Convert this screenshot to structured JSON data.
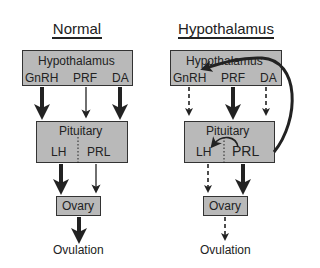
{
  "panels": [
    {
      "title": "Normal",
      "hypothalamus": {
        "label": "Hypothalamus",
        "hormones": [
          "GnRH",
          "PRF",
          "DA"
        ]
      },
      "pituitary": {
        "label": "Pituitary",
        "hormones": [
          "LH",
          "PRL"
        ]
      },
      "ovary": {
        "label": "Ovary"
      },
      "outcome": "Ovulation",
      "arrows": {
        "GnRH": "thick-solid",
        "PRF": "thin-solid",
        "DA": "thick-solid",
        "LH": "thick-solid",
        "PRL": "thin-solid",
        "ovulation": "thick-solid"
      }
    },
    {
      "title": "Hypothalamus",
      "hypothalamus": {
        "label": "Hypothalamus",
        "hormones": [
          "GnRH",
          "PRF",
          "DA"
        ]
      },
      "pituitary": {
        "label": "Pituitary",
        "hormones": [
          "LH",
          "PRL"
        ]
      },
      "ovary": {
        "label": "Ovary"
      },
      "outcome": "Ovulation",
      "arrows": {
        "GnRH": "dashed",
        "PRF": "thick-solid",
        "DA": "dashed",
        "LH": "dashed",
        "PRL": "thick-solid",
        "ovulation": "dashed",
        "feedback_PRL_to_GnRH": "curved-thick",
        "feedback_PRL_to_LH": "curved-thin"
      }
    }
  ],
  "colors": {
    "box_fill": "#b9b9b9",
    "stroke": "#222222"
  }
}
